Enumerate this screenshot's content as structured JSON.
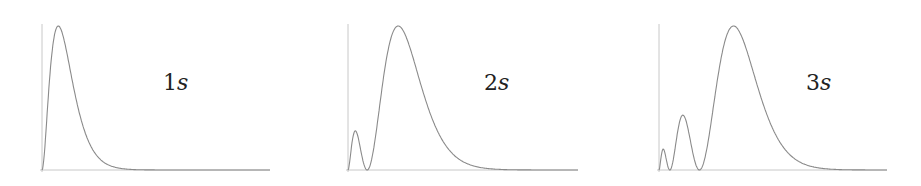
{
  "chart_data": [
    {
      "type": "line",
      "title": "1s",
      "label_number": "1",
      "label_orbital": "s",
      "xlabel": "",
      "ylabel": "",
      "grid": false,
      "description": "Radial probability distribution of 1s orbital: single peak near origin, decays to zero",
      "n": 1,
      "x_range": [
        0,
        14
      ],
      "nodes": 0,
      "peaks": [
        {
          "x": 1.0,
          "y": 1.0
        }
      ],
      "box": {
        "left": 42,
        "right": 270,
        "top": 24,
        "baseline": 170
      },
      "label_pos": {
        "x": 163,
        "y": 70
      }
    },
    {
      "type": "line",
      "title": "2s",
      "label_number": "2",
      "label_orbital": "s",
      "xlabel": "",
      "ylabel": "",
      "grid": false,
      "description": "Radial probability distribution of 2s orbital: small inner peak, one node, large outer peak",
      "n": 2,
      "x_range": [
        0,
        24
      ],
      "nodes": 1,
      "peaks": [
        {
          "x": 0.76,
          "y": 0.27
        },
        {
          "x": 5.24,
          "y": 1.0
        }
      ],
      "box": {
        "left": 348,
        "right": 578,
        "top": 24,
        "baseline": 170
      },
      "label_pos": {
        "x": 484,
        "y": 70
      }
    },
    {
      "type": "line",
      "title": "3s",
      "label_number": "3",
      "label_orbital": "s",
      "xlabel": "",
      "ylabel": "",
      "grid": false,
      "description": "Radial probability distribution of 3s orbital: two small inner peaks, two nodes, large outer peak",
      "n": 3,
      "x_range": [
        0,
        40
      ],
      "nodes": 2,
      "peaks": [
        {
          "x": 0.74,
          "y": 0.14
        },
        {
          "x": 4.19,
          "y": 0.37
        },
        {
          "x": 13.07,
          "y": 1.0
        }
      ],
      "box": {
        "left": 659,
        "right": 887,
        "top": 24,
        "baseline": 170
      },
      "label_pos": {
        "x": 806,
        "y": 70
      }
    }
  ],
  "colors": {
    "axis": "#c8c8c8",
    "curve": "#8a8a8a",
    "label": "#222222"
  }
}
